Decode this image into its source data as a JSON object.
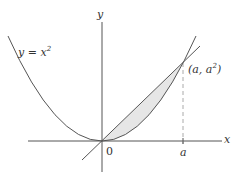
{
  "diagram": {
    "curve_label": {
      "text_main": "y = x",
      "exponent": "2"
    },
    "point_label": {
      "prefix": "(a, a",
      "exponent": "2",
      "suffix": ")"
    },
    "axis_labels": {
      "x": "x",
      "y": "y"
    },
    "tick_labels": {
      "origin": "0",
      "a": "a"
    },
    "colors": {
      "stroke": "#555555",
      "shade": "#e6e6e6",
      "dashed": "#aaaaaa"
    }
  }
}
